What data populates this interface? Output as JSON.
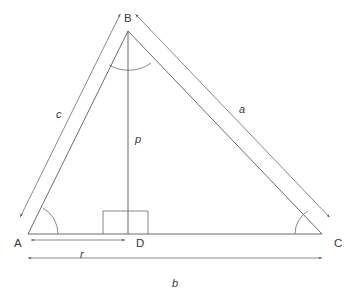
{
  "figure": {
    "name": "triangle-with-altitude",
    "background_color": "#ffffff",
    "stroke_color": "#5a5a5a"
  },
  "vertices": [
    {
      "id": "A",
      "label": "A",
      "x": 28,
      "y": 234,
      "label_x": 14,
      "label_y": 247
    },
    {
      "id": "B",
      "label": "B",
      "x": 128,
      "y": 31,
      "label_x": 124,
      "label_y": 22
    },
    {
      "id": "C",
      "label": "C",
      "x": 322,
      "y": 234,
      "label_x": 334,
      "label_y": 247
    },
    {
      "id": "D",
      "label": "D",
      "x": 128,
      "y": 234,
      "label_x": 136,
      "label_y": 247
    }
  ],
  "sides": [
    {
      "id": "a",
      "label": "a",
      "from": "B",
      "to": "C",
      "label_x": 239,
      "label_y": 113
    },
    {
      "id": "b",
      "label": "b",
      "from": "A",
      "to": "C",
      "label_x": 172,
      "label_y": 287
    },
    {
      "id": "c",
      "label": "c",
      "from": "A",
      "to": "B",
      "label_x": 56,
      "label_y": 118
    },
    {
      "id": "p",
      "label": "p",
      "from": "B",
      "to": "D",
      "label_x": 135,
      "label_y": 143
    },
    {
      "id": "r",
      "label": "r",
      "from": "A",
      "to": "D",
      "label_x": 80,
      "label_y": 258
    }
  ],
  "markers": {
    "right_angle_at": "D",
    "right_angle_box": {
      "x": 103,
      "y": 211,
      "width": 45,
      "height": 23
    },
    "angle_arcs": [
      {
        "at": "A",
        "radius": 30
      },
      {
        "at": "B",
        "radius": 39
      },
      {
        "at": "C",
        "radius": 27
      }
    ]
  },
  "dimension_lines": [
    {
      "id": "c",
      "orientation": "oblique",
      "arrows": "both"
    },
    {
      "id": "a",
      "orientation": "oblique",
      "arrows": "both"
    },
    {
      "id": "r",
      "orientation": "horizontal",
      "arrows": "both",
      "y": 240
    },
    {
      "id": "b",
      "orientation": "horizontal",
      "arrows": "both",
      "y": 258
    }
  ]
}
